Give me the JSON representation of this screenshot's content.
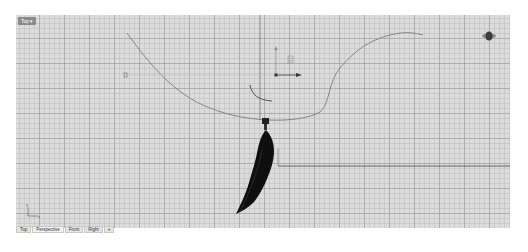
{
  "viewport": {
    "label": "Top ▾",
    "name": "Perspective"
  },
  "tabs": [
    {
      "label": "Top"
    },
    {
      "label": "Perspective"
    },
    {
      "label": "Front"
    },
    {
      "label": "Right"
    },
    {
      "label": "+"
    }
  ],
  "axis_indicator": {
    "x": "x",
    "y": "y"
  },
  "colors": {
    "background": "#dcdcdc",
    "grid": "#969696",
    "curve": "#7a7a7a",
    "feather": "#111111",
    "axis_line": "#555555"
  }
}
